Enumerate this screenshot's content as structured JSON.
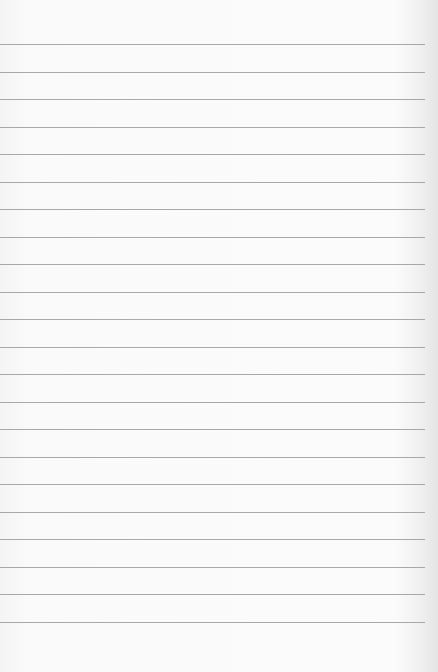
{
  "paper": {
    "type": "ruled-notebook-paper",
    "background_color": "#f9f9f9",
    "line_color": "#9a9a9a",
    "line_count": 22,
    "line_spacing_px": 27.5,
    "first_line_y": 44,
    "line_extent_px": 425
  }
}
